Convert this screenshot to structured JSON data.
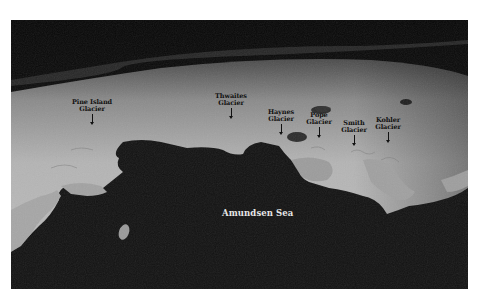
{
  "image": {
    "description": "Oblique satellite view of West Antarctic ice sheet coastline along the Amundsen Sea",
    "colors": {
      "sky": "#0c0c0c",
      "ice": "#b8b8b8",
      "sea": "#141414",
      "label_dark": "#111111",
      "label_light": "#e6e6e6"
    }
  },
  "labels": {
    "pine_island": {
      "line1": "Pine Island",
      "line2": "Glacier"
    },
    "thwaites": {
      "line1": "Thwaites",
      "line2": "Glacier"
    },
    "haynes": {
      "line1": "Haynes",
      "line2": "Glacier"
    },
    "pope": {
      "line1": "Pope",
      "line2": "Glacier"
    },
    "smith": {
      "line1": "Smith",
      "line2": "Glacier"
    },
    "kohler": {
      "line1": "Kohler",
      "line2": "Glacier"
    },
    "sea": "Amundsen Sea"
  }
}
